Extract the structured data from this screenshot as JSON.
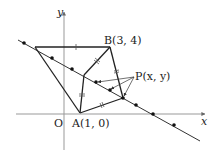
{
  "diagram": {
    "type": "coordinate-geometry",
    "axes": {
      "x_label": "x",
      "y_label": "y",
      "origin_label": "O"
    },
    "points": {
      "A": {
        "label": "A(1, 0)",
        "name": "A",
        "coords": [
          1,
          0
        ]
      },
      "B": {
        "label": "B(3, 4)",
        "name": "B",
        "coords": [
          3,
          4
        ]
      },
      "P": {
        "label": "P(x, y)",
        "name": "P",
        "coords": [
          "x",
          "y"
        ]
      }
    },
    "colors": {
      "line": "#222222",
      "axis": "#888888",
      "background": "#ffffff"
    }
  }
}
